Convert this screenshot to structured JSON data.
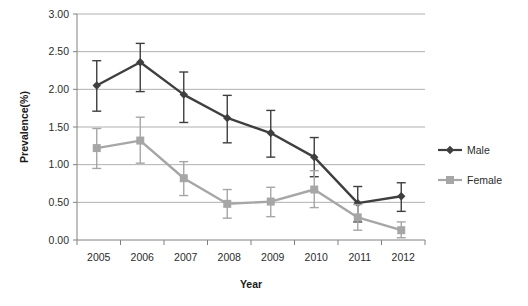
{
  "chart_data": {
    "type": "line",
    "title": "",
    "xlabel": "Year",
    "ylabel": "Prevalence(%)",
    "categories": [
      "2005",
      "2006",
      "2007",
      "2008",
      "2009",
      "2010",
      "2011",
      "2012"
    ],
    "ylim": [
      0.0,
      3.0
    ],
    "ytick_labels": [
      "0.00",
      "0.50",
      "1.00",
      "1.50",
      "2.00",
      "2.50",
      "3.00"
    ],
    "ytick_values": [
      0.0,
      0.5,
      1.0,
      1.5,
      2.0,
      2.5,
      3.0
    ],
    "grid": "horizontal",
    "legend_position": "right",
    "series": [
      {
        "name": "Male",
        "marker": "diamond",
        "color": "#3f3f3f",
        "values": [
          2.05,
          2.36,
          1.93,
          1.62,
          1.42,
          1.1,
          0.49,
          0.58
        ],
        "err_low": [
          1.71,
          1.97,
          1.56,
          1.29,
          1.1,
          0.84,
          0.24,
          0.38
        ],
        "err_high": [
          2.38,
          2.61,
          2.23,
          1.92,
          1.72,
          1.36,
          0.71,
          0.76
        ]
      },
      {
        "name": "Female",
        "marker": "square",
        "color": "#a6a6a6",
        "values": [
          1.22,
          1.32,
          0.82,
          0.48,
          0.51,
          0.67,
          0.3,
          0.13
        ],
        "err_low": [
          0.95,
          1.02,
          0.59,
          0.29,
          0.31,
          0.43,
          0.13,
          0.03
        ],
        "err_high": [
          1.48,
          1.63,
          1.04,
          0.67,
          0.7,
          0.92,
          0.47,
          0.24
        ]
      }
    ]
  },
  "legend": {
    "items": [
      {
        "label": "Male"
      },
      {
        "label": "Female"
      }
    ]
  },
  "colors": {
    "male": "#3f3f3f",
    "female": "#a6a6a6",
    "grid": "#b0b0b0",
    "axis": "#808080",
    "text": "#2b2b2b"
  }
}
